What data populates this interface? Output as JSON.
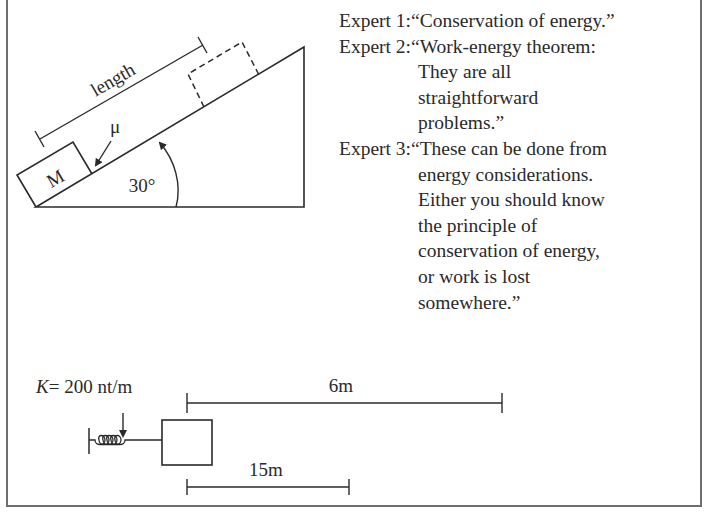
{
  "incline_figure": {
    "length_label": "length",
    "mass_label": "M",
    "friction_label": "μ",
    "angle_label": "30°"
  },
  "spring_figure": {
    "spring_constant_label": "K= 200 nt/m",
    "spring_constant_symbol": "K",
    "spring_constant_value": "= 200 nt/m",
    "top_distance_label": "6m",
    "bottom_distance_label": "15m"
  },
  "experts": [
    {
      "label": "Expert 1: ",
      "lines": [
        "“Conservation of energy.”"
      ]
    },
    {
      "label": "Expert 2: ",
      "lines": [
        "“Work-energy theorem:",
        "They are all",
        "straightforward",
        "problems.”"
      ]
    },
    {
      "label": "Expert 3: ",
      "lines": [
        "“These can be done from",
        "energy considerations.",
        "Either you should know",
        "the principle of",
        "conservation of energy,",
        "or work is lost",
        "somewhere.”"
      ]
    }
  ],
  "colors": {
    "ink": "#2a2a2a",
    "frame": "#6e6e6e",
    "background": "#ffffff"
  }
}
